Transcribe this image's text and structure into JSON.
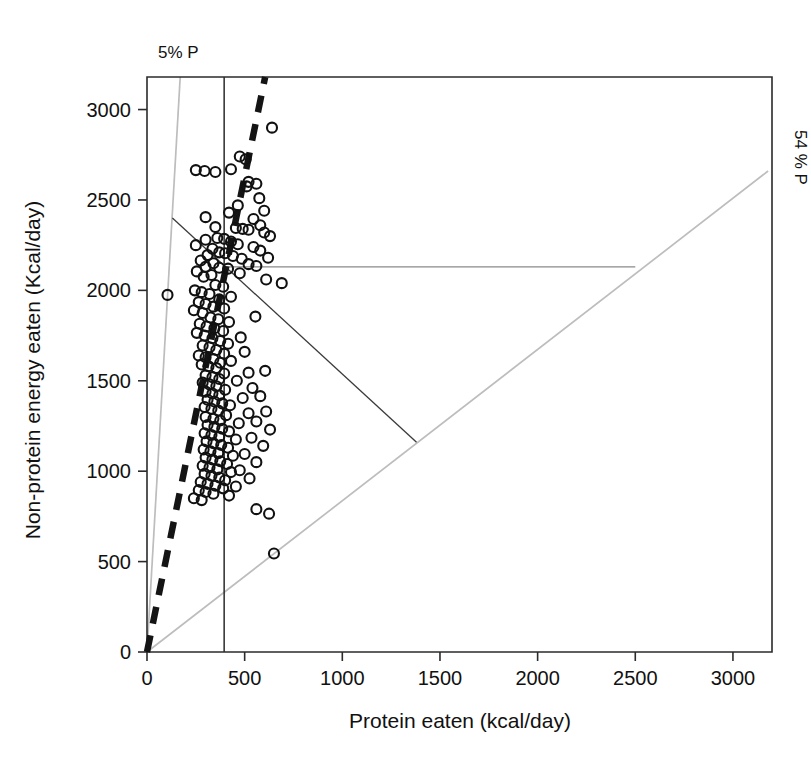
{
  "figure": {
    "background": "#ffffff",
    "axis_color": "#2b2b2b",
    "rail_color": "#bdbdbd",
    "point_color": "#111111"
  },
  "axes": {
    "x_title": "Protein eaten (kcal/day)",
    "y_title": "Non-protein energy eaten (Kcal/day)",
    "x_ticks": [
      "0",
      "500",
      "1000",
      "1500",
      "2000",
      "2500",
      "3000"
    ],
    "y_ticks": [
      "0",
      "500",
      "1000",
      "1500",
      "2000",
      "2500",
      "3000"
    ]
  },
  "annotations": {
    "left_rail_label": "5% P",
    "right_rail_label": "54 % P"
  },
  "chart_data": {
    "type": "scatter",
    "title": "",
    "xlabel": "Protein eaten (kcal/day)",
    "ylabel": "Non-protein energy eaten (Kcal/day)",
    "xlim": [
      0,
      3200
    ],
    "ylim": [
      0,
      3180
    ],
    "grid": false,
    "legend": "none",
    "annotations": [
      {
        "text": "5% P",
        "x": 200,
        "y": 3280,
        "note": "label for steep left nutritional rail"
      },
      {
        "text": "54 % P",
        "x": 3330,
        "y": 2660,
        "note": "label for shallow right nutritional rail, rotated 90 degrees"
      }
    ],
    "reference_lines": [
      {
        "name": "rail-5pct-P",
        "type": "ray",
        "from": [
          0,
          0
        ],
        "to": [
          170,
          3180
        ],
        "color": "#bdbdbd",
        "style": "solid",
        "label": "5% P"
      },
      {
        "name": "rail-54pct-P",
        "type": "ray",
        "from": [
          0,
          0
        ],
        "to": [
          3180,
          2660
        ],
        "color": "#bdbdbd",
        "style": "solid",
        "label": "54 % P"
      },
      {
        "name": "intake-target-vertical",
        "type": "segment",
        "from": [
          395,
          0
        ],
        "to": [
          395,
          3180
        ],
        "color": "#2b2b2b",
        "style": "solid"
      },
      {
        "name": "protein-prioritisation-dashed",
        "type": "segment",
        "from": [
          0,
          0
        ],
        "to": [
          605,
          3180
        ],
        "color": "#141414",
        "style": "thick-dashed"
      },
      {
        "name": "intake-array-horizontal",
        "type": "segment",
        "from": [
          395,
          2130
        ],
        "to": [
          2500,
          2130
        ],
        "color": "#8a8a8a",
        "style": "solid"
      },
      {
        "name": "intake-array-diagonal",
        "type": "segment",
        "from": [
          130,
          2400
        ],
        "to": [
          1380,
          1160
        ],
        "color": "#3a3a3a",
        "style": "solid"
      }
    ],
    "points": [
      [
        640,
        2900
      ],
      [
        475,
        2740
      ],
      [
        505,
        2725
      ],
      [
        430,
        2670
      ],
      [
        250,
        2665
      ],
      [
        295,
        2660
      ],
      [
        350,
        2655
      ],
      [
        520,
        2600
      ],
      [
        560,
        2590
      ],
      [
        510,
        2575
      ],
      [
        575,
        2510
      ],
      [
        465,
        2470
      ],
      [
        600,
        2440
      ],
      [
        420,
        2430
      ],
      [
        300,
        2405
      ],
      [
        545,
        2395
      ],
      [
        580,
        2360
      ],
      [
        350,
        2350
      ],
      [
        455,
        2345
      ],
      [
        490,
        2340
      ],
      [
        520,
        2335
      ],
      [
        600,
        2320
      ],
      [
        630,
        2300
      ],
      [
        360,
        2290
      ],
      [
        395,
        2285
      ],
      [
        300,
        2280
      ],
      [
        430,
        2270
      ],
      [
        465,
        2255
      ],
      [
        250,
        2250
      ],
      [
        545,
        2240
      ],
      [
        335,
        2230
      ],
      [
        580,
        2220
      ],
      [
        370,
        2210
      ],
      [
        400,
        2205
      ],
      [
        105,
        1975
      ],
      [
        310,
        2195
      ],
      [
        440,
        2190
      ],
      [
        620,
        2180
      ],
      [
        485,
        2175
      ],
      [
        275,
        2165
      ],
      [
        340,
        2150
      ],
      [
        520,
        2145
      ],
      [
        560,
        2135
      ],
      [
        300,
        2130
      ],
      [
        370,
        2125
      ],
      [
        415,
        2120
      ],
      [
        255,
        2105
      ],
      [
        475,
        2095
      ],
      [
        330,
        2085
      ],
      [
        290,
        2075
      ],
      [
        610,
        2060
      ],
      [
        690,
        2040
      ],
      [
        350,
        2030
      ],
      [
        390,
        2020
      ],
      [
        245,
        2000
      ],
      [
        280,
        1990
      ],
      [
        320,
        1980
      ],
      [
        430,
        1965
      ],
      [
        370,
        1950
      ],
      [
        265,
        1935
      ],
      [
        300,
        1925
      ],
      [
        340,
        1910
      ],
      [
        395,
        1900
      ],
      [
        240,
        1890
      ],
      [
        285,
        1875
      ],
      [
        555,
        1855
      ],
      [
        325,
        1850
      ],
      [
        365,
        1840
      ],
      [
        420,
        1825
      ],
      [
        270,
        1815
      ],
      [
        305,
        1800
      ],
      [
        345,
        1790
      ],
      [
        390,
        1775
      ],
      [
        255,
        1765
      ],
      [
        295,
        1750
      ],
      [
        480,
        1740
      ],
      [
        335,
        1735
      ],
      [
        375,
        1720
      ],
      [
        415,
        1705
      ],
      [
        285,
        1695
      ],
      [
        320,
        1685
      ],
      [
        355,
        1670
      ],
      [
        500,
        1660
      ],
      [
        395,
        1650
      ],
      [
        265,
        1640
      ],
      [
        300,
        1630
      ],
      [
        340,
        1620
      ],
      [
        430,
        1610
      ],
      [
        375,
        1600
      ],
      [
        280,
        1590
      ],
      [
        315,
        1580
      ],
      [
        355,
        1570
      ],
      [
        605,
        1555
      ],
      [
        520,
        1545
      ],
      [
        395,
        1540
      ],
      [
        300,
        1530
      ],
      [
        335,
        1520
      ],
      [
        370,
        1510
      ],
      [
        460,
        1500
      ],
      [
        285,
        1490
      ],
      [
        320,
        1480
      ],
      [
        355,
        1470
      ],
      [
        540,
        1460
      ],
      [
        400,
        1450
      ],
      [
        300,
        1440
      ],
      [
        335,
        1430
      ],
      [
        370,
        1420
      ],
      [
        580,
        1415
      ],
      [
        490,
        1405
      ],
      [
        310,
        1395
      ],
      [
        345,
        1385
      ],
      [
        385,
        1375
      ],
      [
        425,
        1365
      ],
      [
        295,
        1355
      ],
      [
        330,
        1345
      ],
      [
        365,
        1335
      ],
      [
        610,
        1330
      ],
      [
        520,
        1320
      ],
      [
        405,
        1310
      ],
      [
        300,
        1300
      ],
      [
        340,
        1290
      ],
      [
        375,
        1280
      ],
      [
        560,
        1275
      ],
      [
        470,
        1265
      ],
      [
        310,
        1255
      ],
      [
        345,
        1245
      ],
      [
        385,
        1235
      ],
      [
        630,
        1230
      ],
      [
        420,
        1220
      ],
      [
        295,
        1210
      ],
      [
        330,
        1200
      ],
      [
        370,
        1190
      ],
      [
        535,
        1185
      ],
      [
        455,
        1175
      ],
      [
        305,
        1165
      ],
      [
        340,
        1155
      ],
      [
        380,
        1145
      ],
      [
        595,
        1140
      ],
      [
        415,
        1130
      ],
      [
        290,
        1120
      ],
      [
        325,
        1110
      ],
      [
        365,
        1100
      ],
      [
        500,
        1095
      ],
      [
        440,
        1085
      ],
      [
        300,
        1075
      ],
      [
        335,
        1065
      ],
      [
        375,
        1055
      ],
      [
        560,
        1050
      ],
      [
        410,
        1040
      ],
      [
        285,
        1030
      ],
      [
        320,
        1020
      ],
      [
        360,
        1010
      ],
      [
        475,
        1005
      ],
      [
        430,
        995
      ],
      [
        295,
        985
      ],
      [
        330,
        975
      ],
      [
        370,
        965
      ],
      [
        525,
        960
      ],
      [
        400,
        950
      ],
      [
        275,
        940
      ],
      [
        310,
        930
      ],
      [
        350,
        920
      ],
      [
        455,
        915
      ],
      [
        390,
        905
      ],
      [
        265,
        895
      ],
      [
        300,
        885
      ],
      [
        340,
        875
      ],
      [
        420,
        865
      ],
      [
        240,
        850
      ],
      [
        280,
        840
      ],
      [
        560,
        790
      ],
      [
        625,
        765
      ],
      [
        650,
        545
      ]
    ]
  }
}
